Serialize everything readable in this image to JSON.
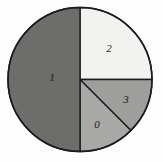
{
  "chart_data": {
    "type": "pie",
    "title": "",
    "subtitle": "",
    "xlabel": "",
    "ylabel": "",
    "legend": "none",
    "grid": false,
    "labels_on_slices": true,
    "center": {
      "cx": 80,
      "cy": 79.5
    },
    "radius": 72,
    "start_angle_deg": 0,
    "direction": "clockwise",
    "categories": [
      "0",
      "1",
      "2",
      "3"
    ],
    "values": [
      12.5,
      50,
      25,
      12.5
    ],
    "units": "percent",
    "slices": [
      {
        "label": "2",
        "value": 25,
        "fraction": 0.25,
        "start_angle_deg": 0,
        "end_angle_deg": 90,
        "color": "#f2f2f0",
        "label_x": 109,
        "label_y": 49
      },
      {
        "label": "3",
        "value": 12.5,
        "fraction": 0.125,
        "start_angle_deg": 90,
        "end_angle_deg": 135,
        "color": "#9e9e9c",
        "label_x": 126,
        "label_y": 100
      },
      {
        "label": "0",
        "value": 12.5,
        "fraction": 0.125,
        "start_angle_deg": 135,
        "end_angle_deg": 180,
        "color": "#a8a8a6",
        "label_x": 97,
        "label_y": 125
      },
      {
        "label": "1",
        "value": 50,
        "fraction": 0.5,
        "start_angle_deg": 180,
        "end_angle_deg": 360,
        "color": "#6d6d6b",
        "label_x": 52,
        "label_y": 78
      }
    ],
    "colors": {
      "slice_2": "#f2f2f0",
      "slice_3": "#9e9e9c",
      "slice_0": "#a8a8a6",
      "slice_1": "#6d6d6b",
      "outline": "#1c1c1c",
      "background": "#fdfdfd",
      "label_text": "#1a1a1a"
    }
  }
}
